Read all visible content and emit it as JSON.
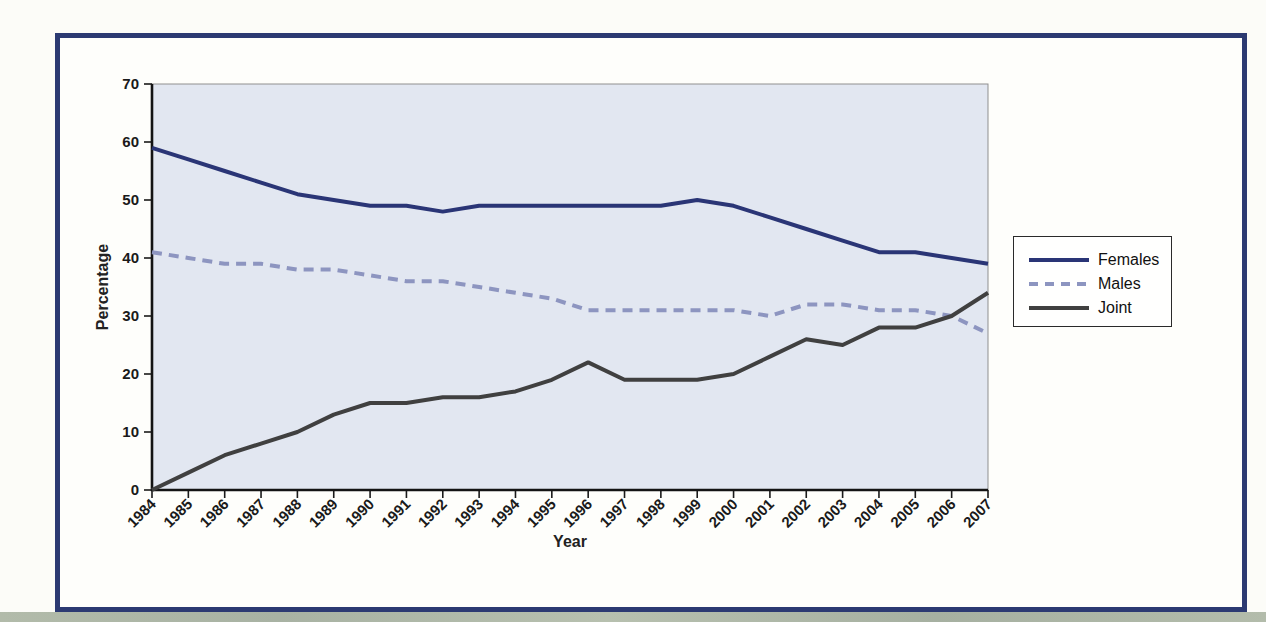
{
  "chart_data": {
    "type": "line",
    "title": "",
    "xlabel": "Year",
    "ylabel": "Percentage",
    "x": [
      1984,
      1985,
      1986,
      1987,
      1988,
      1989,
      1990,
      1991,
      1992,
      1993,
      1994,
      1995,
      1996,
      1997,
      1998,
      1999,
      2000,
      2001,
      2002,
      2003,
      2004,
      2005,
      2006,
      2007
    ],
    "ylim": [
      0,
      70
    ],
    "yticks": [
      0,
      10,
      20,
      30,
      40,
      50,
      60,
      70
    ],
    "grid": false,
    "legend_position": "right",
    "plot_bg": "#e2e7f1",
    "series": [
      {
        "name": "Females",
        "style": "solid",
        "color": "#2a3576",
        "values": [
          59,
          57,
          55,
          53,
          51,
          50,
          49,
          49,
          48,
          49,
          49,
          49,
          49,
          49,
          49,
          50,
          49,
          47,
          45,
          43,
          41,
          41,
          40,
          39
        ]
      },
      {
        "name": "Males",
        "style": "dashed",
        "color": "#8d95c0",
        "values": [
          41,
          40,
          39,
          39,
          38,
          38,
          37,
          36,
          36,
          35,
          34,
          33,
          31,
          31,
          31,
          31,
          31,
          30,
          32,
          32,
          31,
          31,
          30,
          27
        ]
      },
      {
        "name": "Joint",
        "style": "solid",
        "color": "#404040",
        "values": [
          0,
          3,
          6,
          8,
          10,
          13,
          15,
          15,
          16,
          16,
          17,
          19,
          22,
          19,
          19,
          19,
          20,
          23,
          26,
          25,
          28,
          28,
          30,
          34
        ]
      }
    ]
  },
  "colors": {
    "frame_border": "#2c3a72",
    "page_bg": "#fcfcf8",
    "axis": "#1a1a1a",
    "bottom_band": "#aeb8a8"
  }
}
